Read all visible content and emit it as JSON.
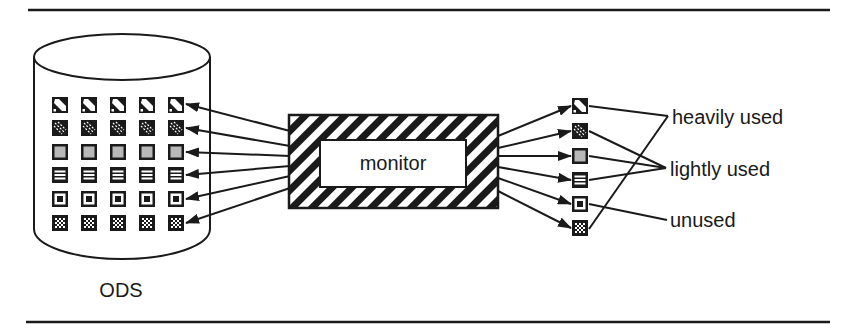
{
  "diagram": {
    "database": {
      "label": "ODS",
      "rows": 6,
      "cols": 5
    },
    "monitor": {
      "label": "monitor"
    },
    "categories": [
      {
        "label": "heavily used"
      },
      {
        "label": "lightly used"
      },
      {
        "label": "unused"
      }
    ],
    "pattern_rows": [
      {
        "pattern": "diagonal-band",
        "category": "heavily used"
      },
      {
        "pattern": "dense-diagonal",
        "category": "lightly used"
      },
      {
        "pattern": "gray-fill",
        "category": "lightly used"
      },
      {
        "pattern": "horizontal-stripes",
        "category": "lightly used"
      },
      {
        "pattern": "ring",
        "category": "unused"
      },
      {
        "pattern": "checker-dots",
        "category": "heavily used"
      }
    ],
    "colors": {
      "ink": "#1a1a1a",
      "gray": "#b8b8b8",
      "paper": "#ffffff"
    }
  }
}
